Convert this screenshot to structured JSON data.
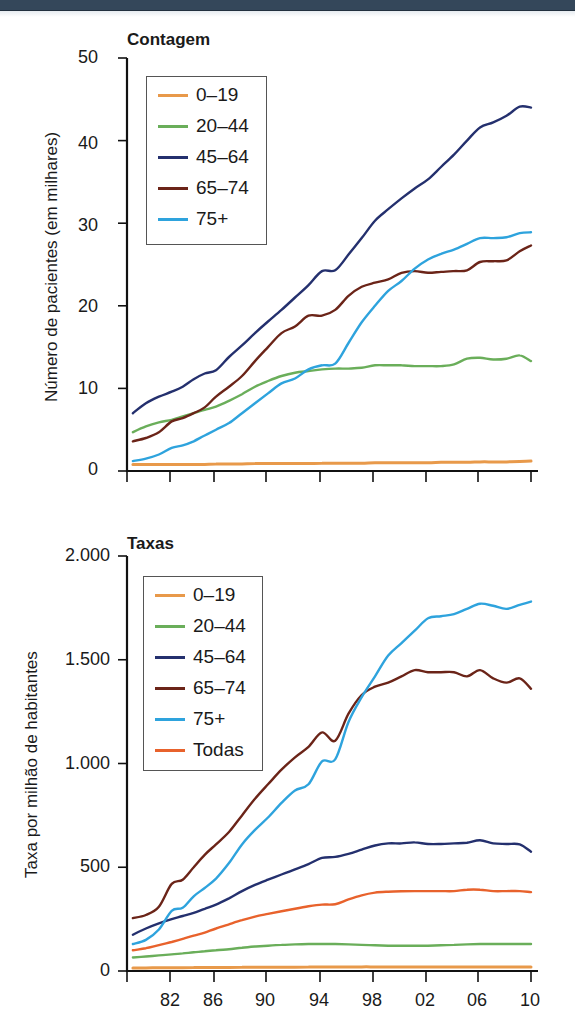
{
  "colors": {
    "0-19": "#e8994a",
    "20-44": "#6aae5a",
    "45-64": "#24306e",
    "65-74": "#6b2418",
    "75+": "#2ea3dd",
    "Todas": "#e8622c"
  },
  "chart_data": [
    {
      "type": "line",
      "title": "Contagem",
      "xlabel": "",
      "ylabel": "Número de pacientes (em milhares)",
      "ylim": [
        0,
        50
      ],
      "yticks": [
        "0",
        "10",
        "20",
        "30",
        "40",
        "50"
      ],
      "xticks": [],
      "grid": false,
      "legend_position": "upper left",
      "x": [
        1979,
        1980,
        1981,
        1982,
        1983,
        1984,
        1985,
        1986,
        1987,
        1988,
        1989,
        1990,
        1991,
        1992,
        1993,
        1994,
        1995,
        1996,
        1997,
        1998,
        1999,
        2000,
        2001,
        2002,
        2003,
        2004,
        2005,
        2006,
        2007,
        2008,
        2009,
        2010
      ],
      "series": [
        {
          "name": "0–19",
          "key": "0-19",
          "values": [
            0.8,
            0.8,
            0.8,
            0.8,
            0.8,
            0.8,
            0.8,
            0.85,
            0.85,
            0.85,
            0.9,
            0.9,
            0.9,
            0.9,
            0.9,
            0.95,
            0.95,
            0.95,
            0.95,
            1.0,
            1.0,
            1.0,
            1.0,
            1.0,
            1.05,
            1.05,
            1.05,
            1.1,
            1.1,
            1.1,
            1.15,
            1.2
          ]
        },
        {
          "name": "20–44",
          "key": "20-44",
          "values": [
            4.7,
            5.4,
            5.9,
            6.2,
            6.6,
            7.0,
            7.4,
            7.8,
            8.5,
            9.3,
            10.2,
            10.9,
            11.5,
            11.9,
            12.1,
            12.3,
            12.4,
            12.4,
            12.5,
            12.8,
            12.8,
            12.8,
            12.7,
            12.7,
            12.7,
            12.9,
            13.6,
            13.7,
            13.5,
            13.6,
            14.0,
            13.3
          ]
        },
        {
          "name": "45–64",
          "key": "45-64",
          "values": [
            7.0,
            8.2,
            9.0,
            9.6,
            10.2,
            11.1,
            11.8,
            12.2,
            13.8,
            15.2,
            16.7,
            18.1,
            19.5,
            21.0,
            22.5,
            24.2,
            24.3,
            26.2,
            28.2,
            30.3,
            31.7,
            33.0,
            34.2,
            35.3,
            36.8,
            38.3,
            40.0,
            41.6,
            42.2,
            43.0,
            44.1,
            44.0
          ]
        },
        {
          "name": "65–74",
          "key": "65-74",
          "values": [
            3.6,
            4.0,
            4.7,
            6.0,
            6.4,
            7.0,
            7.7,
            9.0,
            10.2,
            11.5,
            13.3,
            15.0,
            16.7,
            17.5,
            18.8,
            18.8,
            19.5,
            21.2,
            22.3,
            22.8,
            23.2,
            24.0,
            24.2,
            24.0,
            24.1,
            24.2,
            24.3,
            25.3,
            25.4,
            25.5,
            26.6,
            27.3
          ]
        },
        {
          "name": "75+",
          "key": "75+",
          "values": [
            1.2,
            1.5,
            2.0,
            2.8,
            3.1,
            3.6,
            4.3,
            5.0,
            5.8,
            7.0,
            8.2,
            9.4,
            10.6,
            11.2,
            12.3,
            12.8,
            13.0,
            15.5,
            18.0,
            20.0,
            21.8,
            23.0,
            24.5,
            25.6,
            26.3,
            26.8,
            27.5,
            28.2,
            28.2,
            28.3,
            28.8,
            28.9
          ]
        }
      ]
    },
    {
      "type": "line",
      "title": "Taxas",
      "xlabel": "",
      "ylabel": "Taxa por milhão de habitantes",
      "ylim": [
        0,
        2000
      ],
      "yticks": [
        "0",
        "500",
        "1.000",
        "1.500",
        "2.000"
      ],
      "xticks": [
        "82",
        "86",
        "90",
        "94",
        "98",
        "02",
        "06",
        "10"
      ],
      "grid": false,
      "legend_position": "upper left",
      "x": [
        1979,
        1980,
        1981,
        1982,
        1983,
        1984,
        1985,
        1986,
        1987,
        1988,
        1989,
        1990,
        1991,
        1992,
        1993,
        1994,
        1995,
        1996,
        1997,
        1998,
        1999,
        2000,
        2001,
        2002,
        2003,
        2004,
        2005,
        2006,
        2007,
        2008,
        2009,
        2010
      ],
      "series": [
        {
          "name": "0–19",
          "key": "0-19",
          "values": [
            15,
            15,
            16,
            16,
            16,
            17,
            17,
            17,
            17,
            18,
            18,
            18,
            18,
            18,
            19,
            19,
            19,
            19,
            20,
            20,
            20,
            20,
            20,
            20,
            20,
            20,
            20,
            20,
            20,
            20,
            20,
            20
          ]
        },
        {
          "name": "20–44",
          "key": "20-44",
          "values": [
            65,
            70,
            75,
            80,
            85,
            90,
            95,
            100,
            105,
            112,
            118,
            122,
            126,
            128,
            130,
            130,
            130,
            128,
            126,
            124,
            122,
            122,
            122,
            122,
            124,
            126,
            128,
            130,
            130,
            130,
            130,
            130
          ]
        },
        {
          "name": "45–64",
          "key": "45-64",
          "values": [
            175,
            205,
            230,
            250,
            265,
            280,
            300,
            320,
            350,
            385,
            415,
            440,
            465,
            490,
            515,
            545,
            550,
            565,
            585,
            605,
            615,
            615,
            620,
            612,
            612,
            615,
            618,
            630,
            615,
            612,
            610,
            575
          ]
        },
        {
          "name": "65–74",
          "key": "65-74",
          "values": [
            255,
            270,
            310,
            420,
            440,
            500,
            560,
            610,
            670,
            750,
            830,
            900,
            970,
            1030,
            1080,
            1150,
            1110,
            1240,
            1330,
            1370,
            1390,
            1420,
            1450,
            1440,
            1440,
            1440,
            1420,
            1450,
            1410,
            1390,
            1410,
            1360
          ]
        },
        {
          "name": "75+",
          "key": "75+",
          "values": [
            130,
            150,
            200,
            290,
            305,
            360,
            400,
            445,
            520,
            610,
            680,
            740,
            810,
            870,
            900,
            1010,
            1020,
            1200,
            1320,
            1420,
            1520,
            1580,
            1640,
            1700,
            1710,
            1720,
            1745,
            1770,
            1760,
            1745,
            1765,
            1780
          ]
        },
        {
          "name": "Todas",
          "key": "Todas",
          "values": [
            100,
            110,
            125,
            140,
            155,
            170,
            185,
            205,
            225,
            245,
            262,
            275,
            288,
            300,
            312,
            320,
            322,
            345,
            365,
            378,
            382,
            384,
            385,
            385,
            385,
            385,
            392,
            392,
            385,
            385,
            385,
            380
          ]
        }
      ]
    }
  ],
  "top_panel": {
    "title": "Contagem",
    "ylabel": "Número de pacientes (em milhares)",
    "yticks": [
      "50",
      "40",
      "30",
      "20",
      "10",
      "0"
    ],
    "legend": [
      "0–19",
      "20–44",
      "45–64",
      "65–74",
      "75+"
    ]
  },
  "bottom_panel": {
    "title": "Taxas",
    "ylabel": "Taxa por milhão de habitantes",
    "yticks": [
      "2.000",
      "1.500",
      "1.000",
      "500",
      "0"
    ],
    "xticks": [
      "82",
      "86",
      "90",
      "94",
      "98",
      "02",
      "06",
      "10"
    ],
    "legend": [
      "0–19",
      "20–44",
      "45–64",
      "65–74",
      "75+",
      "Todas"
    ]
  }
}
